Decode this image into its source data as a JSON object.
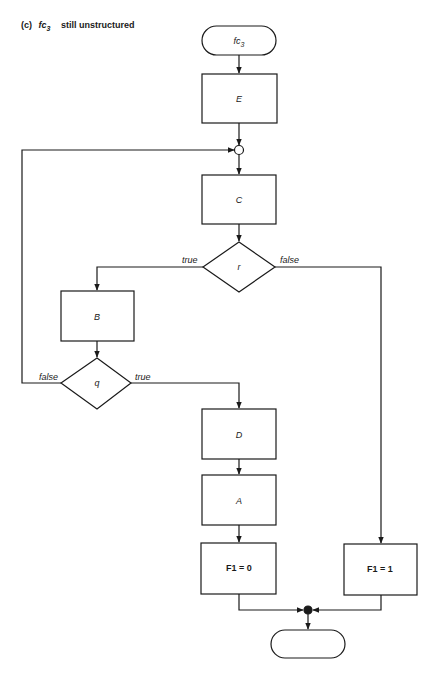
{
  "caption": {
    "prefix": "(c)",
    "function_name": "fc",
    "function_subscript": "3",
    "description": "still unstructured"
  },
  "flowchart": {
    "start_terminal": {
      "label": "fc",
      "subscript": "3"
    },
    "process_E": {
      "label": "E"
    },
    "connector": {
      "type": "junction-circle"
    },
    "process_C": {
      "label": "C"
    },
    "decision_r": {
      "label": "r",
      "true_label": "true",
      "false_label": "false"
    },
    "process_B": {
      "label": "B"
    },
    "decision_q": {
      "label": "q",
      "true_label": "true",
      "false_label": "false"
    },
    "process_D": {
      "label": "D"
    },
    "process_A": {
      "label": "A"
    },
    "assign_F1_0": {
      "label": "F1 = 0"
    },
    "assign_F1_1": {
      "label": "F1 = 1"
    },
    "merge_point": {
      "type": "filled-dot"
    },
    "end_terminal": {
      "label": ""
    }
  },
  "colors": {
    "stroke": "#1a1a1a",
    "background": "#ffffff"
  }
}
